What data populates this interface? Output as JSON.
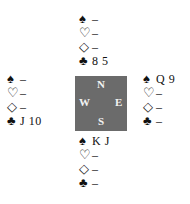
{
  "compass": {
    "north": "N",
    "west": "W",
    "east": "E",
    "south": "S",
    "color": "#6b6b6b"
  },
  "suits": {
    "spades": "♠",
    "hearts": "♡",
    "diamonds": "◇",
    "clubs": "♣"
  },
  "hands": {
    "north": {
      "spades": "–",
      "hearts": "–",
      "diamonds": "–",
      "clubs": "8 5"
    },
    "west": {
      "spades": "–",
      "hearts": "–",
      "diamonds": "–",
      "clubs": "J 10"
    },
    "east": {
      "spades": "Q 9",
      "hearts": "–",
      "diamonds": "–",
      "clubs": "–"
    },
    "south": {
      "spades": "K J",
      "hearts": "–",
      "diamonds": "–",
      "clubs": "–"
    }
  }
}
